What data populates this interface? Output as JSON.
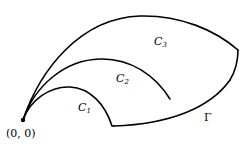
{
  "diagram": {
    "origin": {
      "label": "(0, 0)",
      "x": 23,
      "y": 120
    },
    "curves": [
      {
        "name": "C1",
        "label": "C",
        "subscript": "1"
      },
      {
        "name": "C2",
        "label": "C",
        "subscript": "2"
      },
      {
        "name": "C3",
        "label": "C",
        "subscript": "3"
      },
      {
        "name": "Gamma",
        "label": "Γ"
      }
    ],
    "stroke_color": "#000000",
    "background": "#ffffff"
  }
}
